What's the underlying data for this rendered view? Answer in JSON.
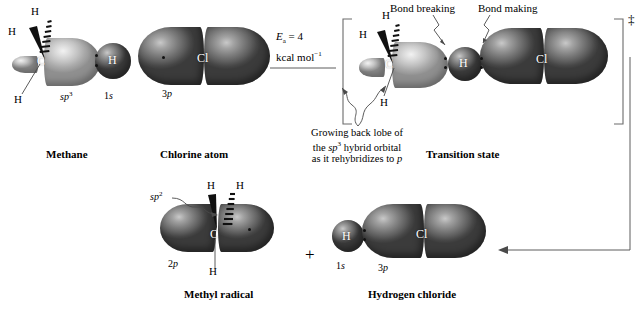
{
  "figure": {
    "title_implicit": "Radical chlorination of methane: orbital picture",
    "plus_sign": "+",
    "dagger": "‡"
  },
  "reactants": {
    "methane": {
      "caption": "Methane",
      "atom_center": "C",
      "atom_h_top": "H",
      "atom_h_dash": "H",
      "atom_h_bottom": "H",
      "atom_h_bonded": "H",
      "orbital_hybrid": "sp",
      "orbital_hybrid_sup": "3",
      "orbital_h": "1",
      "orbital_h_italic": "s"
    },
    "chlorine": {
      "caption": "Chlorine atom",
      "atom": "Cl",
      "orbital": "3",
      "orbital_italic": "p"
    }
  },
  "arrow": {
    "energy_line1_prefix": "E",
    "energy_line1_sub": "a",
    "energy_line1_value": " = 4",
    "energy_line2": "kcal mol",
    "energy_line2_sup": "−1"
  },
  "transition_state": {
    "caption": "Transition state",
    "atom_center": "C",
    "atom_h_top": "H",
    "atom_h_dash": "H",
    "atom_h_bottom": "H",
    "atom_h_transfer": "H",
    "atom_cl": "Cl",
    "label_bond_breaking": "Bond breaking",
    "label_bond_making": "Bond making",
    "annotation_line1": "Growing back lobe of",
    "annotation_line2_a": "the ",
    "annotation_line2_b": "sp",
    "annotation_line2_sup": "3",
    "annotation_line2_c": " hybrid orbital",
    "annotation_line3_a": "as it rehybridizes to ",
    "annotation_line3_b": "p"
  },
  "products": {
    "methyl_radical": {
      "caption": "Methyl radical",
      "atom_center": "C",
      "atom_h_top": "H",
      "atom_h_dash": "H",
      "atom_h_bottom": "H",
      "orbital_hybrid": "sp",
      "orbital_hybrid_sup": "2",
      "orbital_p": "2",
      "orbital_p_italic": "p"
    },
    "hydrogen_chloride": {
      "caption": "Hydrogen chloride",
      "atom_h": "H",
      "atom_cl": "Cl",
      "orbital_h": "1",
      "orbital_h_italic": "s",
      "orbital_cl": "3",
      "orbital_cl_italic": "p"
    }
  },
  "colors": {
    "background": "#ffffff",
    "lobe_dark": "#6e6e6e",
    "lobe_light": "#c8c8c8",
    "text": "#000000",
    "leader_line": "#4a4a4a"
  }
}
